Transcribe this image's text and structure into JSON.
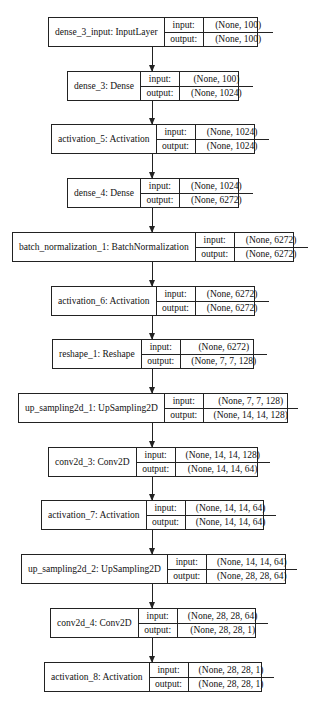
{
  "diagram": {
    "type": "keras-model-plot",
    "io_labels": {
      "input": "input:",
      "output": "output:"
    },
    "layers": [
      {
        "label": "dense_3_input: InputLayer",
        "input": "(None, 100)",
        "output": "(None, 100)",
        "box": {
          "x": 48,
          "y": 17,
          "w": 210,
          "vw": 59
        }
      },
      {
        "label": "dense_3: Dense",
        "input": "(None, 100)",
        "output": "(None, 1024)",
        "box": {
          "x": 67,
          "y": 71,
          "w": 172,
          "vw": 63
        }
      },
      {
        "label": "activation_5: Activation",
        "input": "(None, 1024)",
        "output": "(None, 1024)",
        "box": {
          "x": 51,
          "y": 124,
          "w": 204,
          "vw": 63
        }
      },
      {
        "label": "dense_4: Dense",
        "input": "(None, 1024)",
        "output": "(None, 6272)",
        "box": {
          "x": 67,
          "y": 178,
          "w": 172,
          "vw": 63
        }
      },
      {
        "label": "batch_normalization_1: BatchNormalization",
        "input": "(None, 6272)",
        "output": "(None, 6272)",
        "box": {
          "x": 12,
          "y": 232,
          "w": 282,
          "vw": 63
        }
      },
      {
        "label": "activation_6: Activation",
        "input": "(None, 6272)",
        "output": "(None, 6272)",
        "box": {
          "x": 51,
          "y": 286,
          "w": 204,
          "vw": 63
        }
      },
      {
        "label": "reshape_1: Reshape",
        "input": "(None, 6272)",
        "output": "(None, 7, 7, 128)",
        "box": {
          "x": 52,
          "y": 339,
          "w": 202,
          "vw": 76
        }
      },
      {
        "label": "up_sampling2d_1: UpSampling2D",
        "input": "(None, 7, 7, 128)",
        "output": "(None, 14, 14, 128)",
        "box": {
          "x": 18,
          "y": 393,
          "w": 270,
          "vw": 84
        }
      },
      {
        "label": "conv2d_3: Conv2D",
        "input": "(None, 14, 14, 128)",
        "output": "(None, 14, 14, 64)",
        "box": {
          "x": 48,
          "y": 447,
          "w": 210,
          "vw": 84
        }
      },
      {
        "label": "activation_7: Activation",
        "input": "(None, 14, 14, 64)",
        "output": "(None, 14, 14, 64)",
        "box": {
          "x": 41,
          "y": 500,
          "w": 223,
          "vw": 80
        }
      },
      {
        "label": "up_sampling2d_2: UpSampling2D",
        "input": "(None, 14, 14, 64)",
        "output": "(None, 28, 28, 64)",
        "box": {
          "x": 21,
          "y": 554,
          "w": 265,
          "vw": 80
        }
      },
      {
        "label": "conv2d_4: Conv2D",
        "input": "(None, 28, 28, 64)",
        "output": "(None, 28, 28, 1)",
        "box": {
          "x": 50,
          "y": 608,
          "w": 206,
          "vw": 80
        }
      },
      {
        "label": "activation_8: Activation",
        "input": "(None, 28, 28, 1)",
        "output": "(None, 28, 28, 1)",
        "box": {
          "x": 44,
          "y": 662,
          "w": 218,
          "vw": 75
        }
      }
    ],
    "colors": {
      "stroke": "#222222",
      "background": "#ffffff",
      "text": "#111111"
    }
  }
}
